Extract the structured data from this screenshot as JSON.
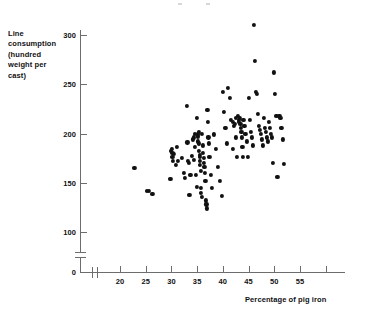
{
  "figure": {
    "background": "#ffffff",
    "ink_color": "#111111",
    "axis_color": "#6d6d6d",
    "width": 378,
    "height": 320
  },
  "axes": {
    "y_label": "Line\nconsumption\n(hundred\nweight per\ncast)",
    "x_label": "Percentage of pig iron",
    "y_ticks": [
      0,
      100,
      150,
      200,
      250,
      300
    ],
    "y_tick_labels": [
      "0",
      "100",
      "150",
      "200",
      "250",
      "300"
    ],
    "x_ticks": [
      20,
      25,
      30,
      35,
      40,
      45,
      50,
      55,
      60
    ],
    "x_tick_labels": [
      "20",
      "25",
      "30",
      "35",
      "40",
      "45",
      "50",
      "55",
      ""
    ],
    "y_axis_break": true,
    "x_axis_break": true,
    "y_break_note": "scale break between 0 and 100",
    "x_break_note": "scale break between origin and 20"
  },
  "chart_data": {
    "type": "scatter",
    "title": "",
    "subtitle": "",
    "xlabel": "Percentage of pig iron",
    "ylabel": "Line consumption (hundred weight per cast)",
    "xlim": [
      17.5,
      62
    ],
    "ylim": [
      100,
      315
    ],
    "grid": false,
    "legend": "none",
    "marker": "filled-circle",
    "marker_color": "#111111",
    "n_points": 133,
    "x": [
      22.8,
      25.2,
      25.6,
      26.3,
      29.8,
      29.9,
      30.1,
      30.2,
      30.2,
      30.3,
      30.5,
      30.8,
      31.0,
      31.3,
      32.0,
      32.4,
      32.6,
      33.0,
      33.1,
      33.2,
      33.4,
      33.5,
      33.7,
      34.0,
      34.2,
      34.3,
      34.4,
      34.5,
      34.6,
      34.8,
      34.9,
      35.0,
      35.1,
      35.2,
      35.2,
      35.3,
      35.3,
      35.4,
      35.5,
      35.5,
      35.6,
      35.6,
      35.7,
      35.8,
      35.8,
      35.9,
      36.0,
      36.1,
      36.2,
      36.3,
      36.3,
      36.4,
      36.5,
      36.6,
      36.7,
      36.8,
      36.9,
      37.0,
      37.1,
      37.2,
      37.3,
      37.4,
      37.6,
      37.8,
      38.2,
      38.6,
      39.0,
      39.4,
      39.8,
      40.0,
      40.2,
      40.5,
      40.8,
      41.0,
      41.3,
      41.6,
      41.9,
      42.0,
      42.2,
      42.4,
      42.5,
      42.6,
      42.8,
      43.0,
      43.1,
      43.2,
      43.3,
      43.4,
      43.5,
      43.6,
      43.7,
      43.8,
      43.9,
      44.0,
      44.2,
      44.4,
      44.6,
      44.8,
      45.0,
      45.2,
      45.4,
      45.6,
      45.8,
      46.0,
      46.2,
      46.4,
      46.6,
      46.8,
      47.0,
      47.2,
      47.4,
      47.6,
      47.8,
      48.0,
      48.2,
      48.4,
      48.6,
      48.8,
      49.0,
      49.2,
      49.4,
      49.6,
      49.8,
      50.0,
      50.2,
      50.4,
      50.6,
      51.0,
      51.2,
      51.4,
      51.6,
      51.8
    ],
    "y": [
      165,
      142,
      142,
      139,
      154,
      182,
      184,
      180,
      176,
      172,
      179,
      168,
      186,
      172,
      175,
      160,
      155,
      228,
      191,
      172,
      170,
      138,
      158,
      177,
      194,
      196,
      173,
      200,
      186,
      158,
      146,
      216,
      199,
      197,
      192,
      190,
      182,
      202,
      178,
      172,
      176,
      168,
      145,
      162,
      140,
      136,
      200,
      188,
      180,
      175,
      170,
      166,
      160,
      152,
      132,
      128,
      124,
      224,
      212,
      196,
      190,
      176,
      158,
      145,
      199,
      184,
      166,
      152,
      137,
      242,
      222,
      206,
      190,
      246,
      236,
      214,
      184,
      212,
      208,
      210,
      216,
      196,
      176,
      218,
      214,
      212,
      216,
      210,
      206,
      202,
      196,
      186,
      176,
      214,
      208,
      200,
      192,
      176,
      236,
      214,
      202,
      196,
      188,
      310,
      274,
      242,
      240,
      220,
      208,
      204,
      200,
      194,
      188,
      216,
      206,
      202,
      196,
      192,
      212,
      206,
      200,
      196,
      170,
      262,
      240,
      218,
      156,
      218,
      216,
      206,
      194,
      169
    ]
  }
}
